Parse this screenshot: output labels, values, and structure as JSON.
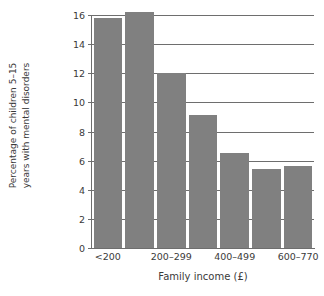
{
  "chart_data": {
    "type": "bar",
    "title": "",
    "subtitle": "",
    "xlabel": "Family income (£)",
    "ylabel": "Percentage of children 5–15 years with mental disorders",
    "ylabel_line1": "Percentage of children 5–15",
    "ylabel_line2": "years with mental disorders",
    "categories": [
      "<200",
      "",
      "200–299",
      "",
      "400–499",
      "",
      "600–770"
    ],
    "tick_labels_shown": [
      "<200",
      "200–299",
      "400–499",
      "600–770"
    ],
    "values": [
      15.8,
      16.2,
      12.0,
      9.1,
      6.5,
      5.45,
      5.65
    ],
    "ylim": [
      0,
      16
    ],
    "xlim": [
      0,
      7
    ],
    "yticks": [
      0,
      2,
      4,
      6,
      8,
      10,
      12,
      14,
      16
    ],
    "ytick_labels": [
      "0",
      "2",
      "4",
      "6",
      "8",
      "10",
      "12",
      "14",
      "16"
    ],
    "grid": "horizontal",
    "legend": "none",
    "bar_color": "#808080",
    "axis_color": "#6e6e6e",
    "text_color": "#3a3a3a",
    "background": "#ffffff",
    "n_bars": 7,
    "labelled_bar_indices": [
      0,
      2,
      4,
      6
    ]
  }
}
